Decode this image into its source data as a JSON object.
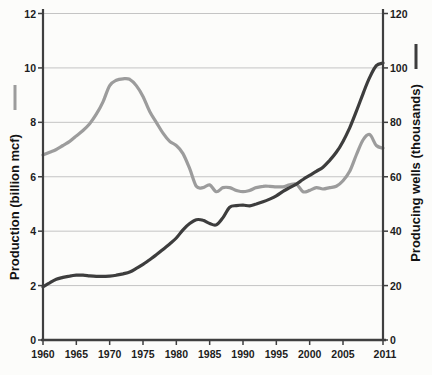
{
  "chart_data": {
    "type": "line",
    "title": "",
    "x_label": "",
    "x_range": [
      1960,
      2011
    ],
    "x_ticks": [
      1960,
      1965,
      1970,
      1975,
      1980,
      1985,
      1990,
      1995,
      2000,
      2005,
      2011
    ],
    "grid": true,
    "legend_position": "axis-titles",
    "left_axis": {
      "label": "Production (billion mcf)",
      "range": [
        0,
        12
      ],
      "ticks": [
        0,
        2,
        4,
        6,
        8,
        10,
        12
      ]
    },
    "right_axis": {
      "label": "Producing wells (thousands)",
      "range": [
        0,
        120
      ],
      "ticks": [
        0,
        20,
        40,
        60,
        80,
        100,
        120
      ]
    },
    "x": [
      1960,
      1961,
      1962,
      1963,
      1964,
      1965,
      1966,
      1967,
      1968,
      1969,
      1970,
      1971,
      1972,
      1973,
      1974,
      1975,
      1976,
      1977,
      1978,
      1979,
      1980,
      1981,
      1982,
      1983,
      1984,
      1985,
      1986,
      1987,
      1988,
      1989,
      1990,
      1991,
      1992,
      1993,
      1994,
      1995,
      1996,
      1997,
      1998,
      1999,
      2000,
      2001,
      2002,
      2003,
      2004,
      2005,
      2006,
      2007,
      2008,
      2009,
      2010,
      2011
    ],
    "series": [
      {
        "id": "production-line",
        "name": "Production (billion mcf)",
        "axis": "left",
        "color": "#9c9c9c",
        "width": 3.2,
        "values": [
          6.8,
          6.9,
          7.0,
          7.15,
          7.3,
          7.5,
          7.7,
          7.95,
          8.3,
          8.75,
          9.35,
          9.55,
          9.6,
          9.58,
          9.35,
          8.95,
          8.4,
          8.0,
          7.6,
          7.3,
          7.15,
          6.85,
          6.3,
          5.65,
          5.6,
          5.7,
          5.45,
          5.6,
          5.6,
          5.5,
          5.45,
          5.5,
          5.6,
          5.65,
          5.65,
          5.63,
          5.63,
          5.7,
          5.73,
          5.45,
          5.5,
          5.6,
          5.55,
          5.6,
          5.65,
          5.85,
          6.2,
          6.8,
          7.35,
          7.55,
          7.15,
          7.05
        ]
      },
      {
        "id": "wells-line",
        "name": "Producing wells (thousands)",
        "axis": "right",
        "color": "#3d3d3d",
        "width": 3.2,
        "values": [
          19.5,
          21.0,
          22.3,
          23.0,
          23.5,
          23.8,
          23.8,
          23.6,
          23.4,
          23.4,
          23.5,
          23.8,
          24.3,
          25.0,
          26.3,
          27.8,
          29.5,
          31.3,
          33.3,
          35.3,
          37.5,
          40.5,
          42.8,
          44.2,
          44.0,
          42.8,
          42.3,
          45.0,
          48.8,
          49.4,
          49.6,
          49.3,
          50.0,
          50.8,
          51.8,
          53.0,
          54.6,
          56.0,
          57.3,
          59.0,
          60.5,
          62.0,
          63.5,
          66.0,
          69.0,
          73.0,
          78.0,
          84.0,
          90.5,
          96.5,
          100.8,
          101.8
        ]
      }
    ],
    "colors": {
      "grid": "#c4c4c4",
      "axis": "#3f3f3f",
      "tick_text": "#1d1d1d",
      "background": "#fcfcfa"
    }
  }
}
